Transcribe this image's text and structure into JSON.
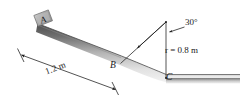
{
  "figure": {
    "type": "physics-mechanics-diagram",
    "background_color": "#ffffff",
    "line_color": "#1a1a1a",
    "surface_fill_dark": "#585858",
    "surface_fill_light": "#e8e8e8",
    "block_fill": "#b0b0b0"
  },
  "labels": {
    "block": "A",
    "arc_start_point": "B",
    "arc_end_point": "C",
    "angle": "30°",
    "radius": "r = 0.8 m",
    "incline_length": "1.2 m"
  },
  "geometry": {
    "incline_angle_degrees": 30,
    "incline_length_m": 1.2,
    "arc_radius_m": 0.8,
    "points": {
      "incline_top": [
        38,
        27
      ],
      "incline_bottom_B": [
        122,
        59
      ],
      "arc_end_C": [
        166,
        78
      ],
      "arc_center": [
        166,
        22
      ],
      "surface_right_end": [
        240,
        80
      ]
    }
  },
  "annotations": {
    "dimension_line": {
      "label": "1.2 m",
      "from": [
        20,
        53
      ],
      "to": [
        116,
        88
      ],
      "has_arrowheads": true,
      "has_end_ticks": true
    },
    "angle_leader": {
      "label": "30°",
      "arrow_from": [
        183,
        28
      ],
      "arrow_to": [
        168,
        33
      ]
    },
    "radius_arrow": {
      "from": [
        166,
        22
      ],
      "to": [
        133,
        52
      ],
      "description": "arrow from arc center toward point B"
    }
  }
}
